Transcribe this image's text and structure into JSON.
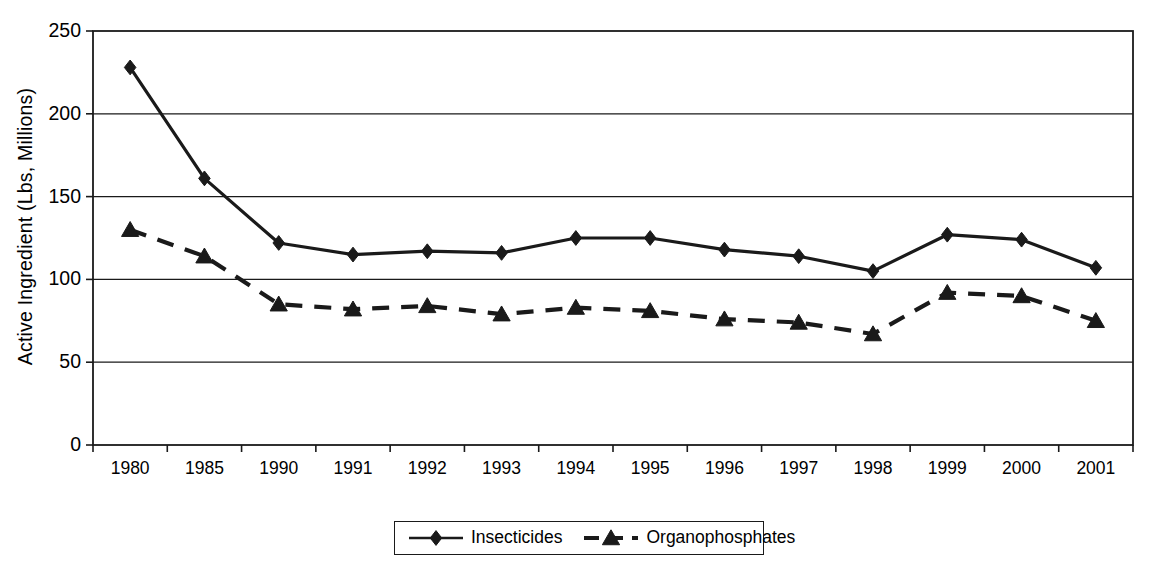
{
  "chart_data": {
    "type": "line",
    "title": "",
    "xlabel": "",
    "ylabel": "Active Ingredient (Lbs, Millions)",
    "categories": [
      "1980",
      "1985",
      "1990",
      "1991",
      "1992",
      "1993",
      "1994",
      "1995",
      "1996",
      "1997",
      "1998",
      "1999",
      "2000",
      "2001"
    ],
    "ylim": [
      0,
      250
    ],
    "yticks": [
      0,
      50,
      100,
      150,
      200,
      250
    ],
    "ytick_labels": [
      "0",
      "50",
      "100",
      "150",
      "200",
      "250"
    ],
    "grid": "horizontal",
    "legend_position": "bottom-center",
    "series": [
      {
        "name": "Insecticides",
        "marker": "diamond",
        "line_style": "solid",
        "color": "#1a1a1a",
        "values": [
          228,
          161,
          122,
          115,
          117,
          116,
          125,
          125,
          118,
          114,
          105,
          127,
          124,
          107
        ]
      },
      {
        "name": "Organophosphates",
        "marker": "triangle",
        "line_style": "dashed",
        "color": "#1a1a1a",
        "values": [
          130,
          114,
          85,
          82,
          84,
          79,
          83,
          81,
          76,
          74,
          67,
          92,
          90,
          75
        ]
      }
    ]
  },
  "legend": {
    "entries": [
      {
        "label": "Insecticides",
        "marker": "diamond-marker-icon",
        "line_style": "solid"
      },
      {
        "label": "Organophosphates",
        "marker": "triangle-marker-icon",
        "line_style": "dashed"
      }
    ]
  },
  "axes": {
    "y_title": "Active Ingredient (Lbs, Millions)"
  }
}
